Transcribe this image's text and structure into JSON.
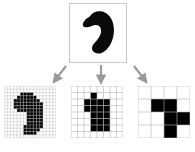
{
  "figure": {
    "background_color": "#ffffff",
    "ink_color": "#000000",
    "grid_line_color": "#b4b4b4",
    "panel_border_color": "#c8c8c8",
    "arrow_color": "#9a9a9a"
  },
  "original": {
    "label": "original-shape",
    "shape_name": "bean-blob",
    "panel_border_color": "#c8c8c8",
    "fill_color": "#0a0a0a",
    "outline_path": "M 20.5 13.0 C 23.5 7.5, 31.0 6.0, 36.5 9.0 C 42.5 12.2, 45.5 19.0, 45.5 26.5 C 45.6 34.5, 43.0 42.5, 37.5 47.5 C 33.0 51.6, 27.5 52.5, 24.5 49.5 C 22.0 47.0, 22.5 43.0, 25.5 40.0 C 30.0 35.5, 33.0 30.5, 32.0 26.0 C 31.2 22.3, 27.5 20.8, 23.0 22.5 C 18.5 24.2, 15.5 25.0, 13.8 23.0 C 11.8 20.6, 16.0 15.0, 20.5 13.0 Z"
  },
  "arrows": [
    {
      "name": "arrow-to-16",
      "direction": "down-left",
      "color": "#9a9a9a",
      "x1": 17,
      "y1": 3,
      "x2": 5,
      "y2": 19
    },
    {
      "name": "arrow-to-8",
      "direction": "down",
      "color": "#9a9a9a",
      "x1": 11,
      "y1": 2,
      "x2": 11,
      "y2": 19
    },
    {
      "name": "arrow-to-4",
      "direction": "down-right",
      "color": "#9a9a9a",
      "x1": 4,
      "y1": 3,
      "x2": 16,
      "y2": 19
    }
  ],
  "chart_data": {
    "type": "heatmap",
    "xlabel": "",
    "ylabel": "",
    "legend_position": "none",
    "grid": true,
    "panels": [
      {
        "name": "raster-16",
        "resolution": "16x16",
        "cols": 16,
        "rows": 16,
        "cell_px": 3.25,
        "grid_line_color": "#b4b4b4",
        "border_color": "#b4b4b4",
        "fill_color": "#000000",
        "filled_cells": [
          [
            5,
            2
          ],
          [
            6,
            2
          ],
          [
            7,
            2
          ],
          [
            8,
            2
          ],
          [
            4,
            3
          ],
          [
            5,
            3
          ],
          [
            6,
            3
          ],
          [
            7,
            3
          ],
          [
            8,
            3
          ],
          [
            9,
            3
          ],
          [
            3,
            4
          ],
          [
            4,
            4
          ],
          [
            5,
            4
          ],
          [
            6,
            4
          ],
          [
            7,
            4
          ],
          [
            8,
            4
          ],
          [
            9,
            4
          ],
          [
            10,
            4
          ],
          [
            3,
            5
          ],
          [
            4,
            5
          ],
          [
            5,
            5
          ],
          [
            6,
            5
          ],
          [
            7,
            5
          ],
          [
            8,
            5
          ],
          [
            9,
            5
          ],
          [
            10,
            5
          ],
          [
            11,
            5
          ],
          [
            3,
            6
          ],
          [
            4,
            6
          ],
          [
            5,
            6
          ],
          [
            6,
            6
          ],
          [
            7,
            6
          ],
          [
            8,
            6
          ],
          [
            9,
            6
          ],
          [
            10,
            6
          ],
          [
            11,
            6
          ],
          [
            4,
            7
          ],
          [
            5,
            7
          ],
          [
            6,
            7
          ],
          [
            7,
            7
          ],
          [
            8,
            7
          ],
          [
            9,
            7
          ],
          [
            10,
            7
          ],
          [
            11,
            7
          ],
          [
            7,
            8
          ],
          [
            8,
            8
          ],
          [
            9,
            8
          ],
          [
            10,
            8
          ],
          [
            11,
            8
          ],
          [
            7,
            9
          ],
          [
            8,
            9
          ],
          [
            9,
            9
          ],
          [
            10,
            9
          ],
          [
            11,
            9
          ],
          [
            7,
            10
          ],
          [
            8,
            10
          ],
          [
            9,
            10
          ],
          [
            10,
            10
          ],
          [
            11,
            10
          ],
          [
            7,
            11
          ],
          [
            8,
            11
          ],
          [
            9,
            11
          ],
          [
            10,
            11
          ],
          [
            11,
            11
          ],
          [
            6,
            12
          ],
          [
            7,
            12
          ],
          [
            8,
            12
          ],
          [
            9,
            12
          ],
          [
            10,
            12
          ],
          [
            11,
            12
          ],
          [
            6,
            13
          ],
          [
            7,
            13
          ],
          [
            8,
            13
          ],
          [
            9,
            13
          ],
          [
            10,
            13
          ],
          [
            6,
            14
          ],
          [
            7,
            14
          ],
          [
            8,
            14
          ],
          [
            9,
            14
          ]
        ]
      },
      {
        "name": "raster-8",
        "resolution": "8x8",
        "cols": 8,
        "rows": 8,
        "cell_px": 6.5,
        "grid_line_color": "#b4b4b4",
        "border_color": "#b4b4b4",
        "fill_color": "#000000",
        "filled_cells": [
          [
            3,
            1
          ],
          [
            2,
            2
          ],
          [
            3,
            2
          ],
          [
            4,
            2
          ],
          [
            5,
            2
          ],
          [
            2,
            3
          ],
          [
            3,
            3
          ],
          [
            4,
            3
          ],
          [
            5,
            3
          ],
          [
            3,
            4
          ],
          [
            4,
            4
          ],
          [
            5,
            4
          ],
          [
            3,
            5
          ],
          [
            4,
            5
          ],
          [
            5,
            5
          ],
          [
            3,
            6
          ],
          [
            4,
            6
          ],
          [
            5,
            6
          ]
        ]
      },
      {
        "name": "raster-4",
        "resolution": "4x4",
        "cols": 4,
        "rows": 4,
        "cell_px": 13,
        "grid_line_color": "#b4b4b4",
        "border_color": "#b4b4b4",
        "fill_color": "#000000",
        "filled_cells": [
          [
            1,
            1
          ],
          [
            2,
            1
          ],
          [
            2,
            2
          ],
          [
            3,
            2
          ],
          [
            2,
            3
          ]
        ]
      }
    ]
  }
}
